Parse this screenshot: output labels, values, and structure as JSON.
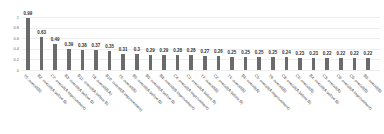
{
  "chart_data": {
    "type": "bar",
    "title": "",
    "xlabel": "",
    "ylabel": "",
    "ylim": [
      0,
      1
    ],
    "yticks": [
      "0",
      "0.2",
      "0.4",
      "0.6",
      "0.8",
      "1"
    ],
    "grid": true,
    "bar_color": "#6b6b6b",
    "categories": [
      "T5: overall(B)",
      "B2: overall(A before B)",
      "C7: overall(A improvement)",
      "B3: overall(A before B)",
      "B11: overall(A before B)",
      "T8: overall(B A)",
      "B10: overall(B improvement)",
      "T6: overall(B)",
      "B5: overall(A before B)",
      "B0: overall(A before B)",
      "B8: overall(B improvement)",
      "C4: overall(A improvement)",
      "C1: overall(A before B)",
      "T7: overall(B)",
      "C2: overall(A before B)",
      "T4: overall(B)",
      "B6: overall(A)",
      "C5: overall(A improvement)",
      "T9: overall(B)",
      "C8: overall(A before B)",
      "C6: overall(B)",
      "B4: overall(A before B)",
      "C3: overall(A)",
      "C9: overall(A improvement)",
      "C0: overall(B)",
      "B9: overall(B)"
    ],
    "values": [
      0.99,
      0.63,
      0.49,
      0.39,
      0.38,
      0.37,
      0.35,
      0.31,
      0.3,
      0.29,
      0.29,
      0.28,
      0.28,
      0.27,
      0.26,
      0.25,
      0.25,
      0.25,
      0.25,
      0.24,
      0.23,
      0.23,
      0.22,
      0.22,
      0.22,
      0.22
    ],
    "value_labels": [
      "0.99",
      "0.63",
      "0.49",
      "0.39",
      "0.38",
      "0.37",
      "0.35",
      "0.31",
      "0.3",
      "0.29",
      "0.29",
      "0.28",
      "0.28",
      "0.27",
      "0.26",
      "0.25",
      "0.25",
      "0.25",
      "0.25",
      "0.24",
      "0.23",
      "0.23",
      "0.22",
      "0.22",
      "0.22",
      "0.22"
    ]
  }
}
